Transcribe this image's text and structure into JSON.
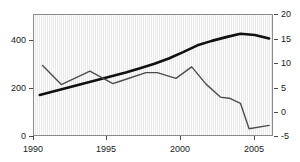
{
  "chart_data": {
    "type": "line",
    "title": "",
    "subtitle": "",
    "xlabel": "",
    "ylabel": "",
    "y2label": "",
    "grid": false,
    "legend": "none",
    "xlim": [
      1989.6,
      1906.2
    ],
    "x_axis": {
      "min": 1989.6,
      "max": 2006.2,
      "ticks": [
        1990,
        1995,
        2000,
        2005
      ],
      "tick_labels": [
        "1990",
        "1995",
        "2000",
        "2005"
      ]
    },
    "y_axis_left": {
      "min": 0,
      "max": 510,
      "ticks": [
        0,
        200,
        400
      ],
      "tick_labels": [
        "0",
        "200",
        "400"
      ]
    },
    "y_axis_right": {
      "min": -5,
      "max": 20,
      "ticks": [
        -5,
        0,
        5,
        10,
        15,
        20
      ],
      "tick_labels": [
        "-5",
        "0",
        "5",
        "10",
        "15",
        "20"
      ]
    },
    "series": [
      {
        "name": "thick-black-series",
        "axis": "left",
        "style": "thick solid black line",
        "color": "#111111",
        "width": 2.6,
        "x": [
          1990.0,
          1991.0,
          1992.0,
          1993.0,
          1994.0,
          1995.0,
          1996.0,
          1997.0,
          1998.0,
          1999.0,
          2000.0,
          2001.0,
          2002.0,
          2003.0,
          2004.0,
          2005.0,
          2006.0
        ],
        "values": [
          170,
          186,
          202,
          218,
          234,
          250,
          266,
          284,
          303,
          325,
          352,
          381,
          400,
          416,
          430,
          425,
          410
        ]
      },
      {
        "name": "thin-gray-series",
        "axis": "right",
        "style": "thin solid gray line",
        "color": "#4d4d4d",
        "width": 1.4,
        "x": [
          1990.2,
          1991.5,
          1993.5,
          1995.1,
          1995.6,
          1997.4,
          1998.2,
          1999.5,
          2000.6,
          2001.6,
          2002.6,
          2003.3,
          2004.0,
          2004.6,
          2006.0
        ],
        "values": [
          9.5,
          5.5,
          8.3,
          5.7,
          6.2,
          8.0,
          8.0,
          6.8,
          9.2,
          5.6,
          2.9,
          2.6,
          1.6,
          -3.7,
          -3.0
        ]
      }
    ]
  },
  "axes": {
    "left_ticks": [
      "400",
      "200",
      "0"
    ],
    "right_ticks": [
      "20",
      "15",
      "10",
      "5",
      "0",
      "-5"
    ],
    "bottom_ticks": [
      "1990",
      "1995",
      "2000",
      "2005"
    ]
  }
}
